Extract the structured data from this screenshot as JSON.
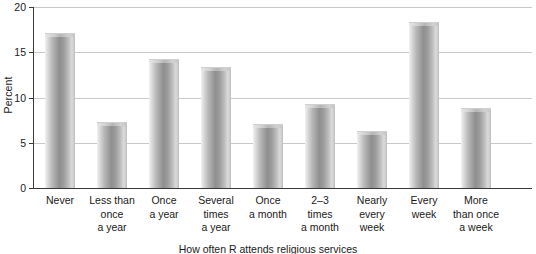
{
  "chart_data": {
    "type": "bar",
    "title": "",
    "subtitle": "",
    "xlabel": "How often R attends religious services",
    "ylabel": "Percent",
    "categories": [
      "Never",
      "Less than\nonce\na year",
      "Once\na year",
      "Several\ntimes\na year",
      "Once\na month",
      "2–3\ntimes\na month",
      "Nearly\nevery\nweek",
      "Every\nweek",
      "More\nthan once\na week"
    ],
    "values": [
      17.0,
      7.2,
      14.2,
      13.3,
      7.0,
      9.2,
      6.2,
      18.2,
      8.7
    ],
    "ylim": [
      0,
      20
    ],
    "yticks": [
      0,
      5,
      10,
      15,
      20
    ],
    "ytick_labels": [
      "0",
      "5",
      "10",
      "15",
      "20"
    ],
    "grid": true,
    "grid_axis": "y",
    "legend": false,
    "legend_position": "none",
    "bar_style": "cylinder-gradient-gray",
    "colors": {
      "bar_light": "#e8e8e8",
      "bar_mid": "#b4b4b4",
      "bar_dark": "#8f8f8f",
      "gridline": "#c9c9c9",
      "axis": "#3a3a3a",
      "text": "#1a1a1a",
      "background": "#ffffff"
    }
  },
  "axis": {
    "y_title": "Percent",
    "x_title": "How often R attends religious services",
    "y_ticks": [
      {
        "label": "20",
        "value": 20
      },
      {
        "label": "15",
        "value": 15
      },
      {
        "label": "10",
        "value": 10
      },
      {
        "label": "5",
        "value": 5
      },
      {
        "label": "0",
        "value": 0
      }
    ]
  }
}
